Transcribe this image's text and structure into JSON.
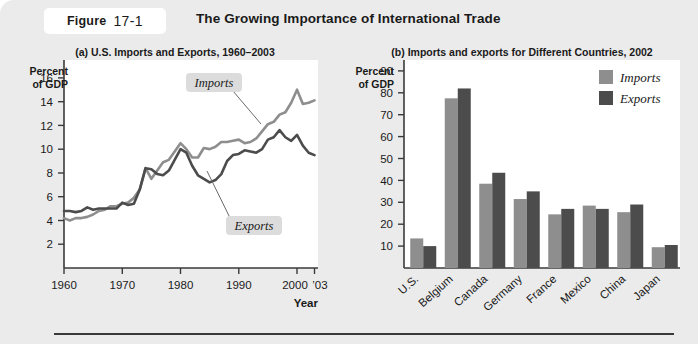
{
  "figure": {
    "tag_label": "Figure",
    "tag_number": "17-1",
    "title": "The Growing Importance of International Trade"
  },
  "colors": {
    "page_background": "#ebebeb",
    "plot_background": "#ffffff",
    "imports_series": "#8e8e8e",
    "exports_series": "#4c4c4c",
    "axis": "#3a3a3a",
    "text": "#1a1a1a",
    "callout_background": "#dcdcdc",
    "rule": "#3a3a3a"
  },
  "panel_a": {
    "title": "(a) U.S. Imports and Exports, 1960–2003",
    "y_axis_caption_line1": "Percent",
    "y_axis_caption_line2": "of GDP",
    "x_axis_caption": "Year",
    "y_ticks": [
      "2",
      "4",
      "6",
      "8",
      "10",
      "12",
      "14",
      "16"
    ],
    "x_ticks": [
      "1960",
      "1970",
      "1980",
      "1990",
      "2000",
      "’03"
    ],
    "callouts": [
      {
        "name": "imports-callout",
        "text": "Imports"
      },
      {
        "name": "exports-callout",
        "text": "Exports"
      }
    ]
  },
  "panel_b": {
    "title": "(b) Imports and exports for Different Countries, 2002",
    "y_axis_caption_line1": "Percent",
    "y_axis_caption_line2": "of GDP",
    "y_ticks": [
      "10",
      "20",
      "30",
      "40",
      "50",
      "60",
      "70",
      "80",
      "90"
    ],
    "legend": [
      {
        "name": "legend-imports",
        "label": "Imports",
        "color": "#8e8e8e"
      },
      {
        "name": "legend-exports",
        "label": "Exports",
        "color": "#4c4c4c"
      }
    ]
  },
  "chart_data": [
    {
      "type": "line",
      "id": "panel-a-line-chart",
      "title": "(a) U.S. Imports and Exports, 1960–2003",
      "xlabel": "Year",
      "ylabel": "Percent of GDP",
      "xlim": [
        1960,
        2003
      ],
      "ylim": [
        0,
        17.5
      ],
      "grid": false,
      "x": [
        1960,
        1961,
        1962,
        1963,
        1964,
        1965,
        1966,
        1967,
        1968,
        1969,
        1970,
        1971,
        1972,
        1973,
        1974,
        1975,
        1976,
        1977,
        1978,
        1979,
        1980,
        1981,
        1982,
        1983,
        1984,
        1985,
        1986,
        1987,
        1988,
        1989,
        1990,
        1991,
        1992,
        1993,
        1994,
        1995,
        1996,
        1997,
        1998,
        1999,
        2000,
        2001,
        2002,
        2003
      ],
      "series": [
        {
          "name": "Imports",
          "color": "#8e8e8e",
          "values": [
            4.2,
            4.0,
            4.2,
            4.2,
            4.3,
            4.5,
            4.8,
            4.9,
            5.2,
            5.2,
            5.4,
            5.5,
            5.9,
            6.6,
            8.4,
            7.5,
            8.2,
            8.9,
            9.1,
            9.8,
            10.5,
            10.0,
            9.3,
            9.3,
            10.1,
            10.0,
            10.2,
            10.6,
            10.6,
            10.7,
            10.8,
            10.5,
            10.6,
            10.9,
            11.5,
            12.1,
            12.3,
            12.9,
            13.1,
            13.9,
            15.0,
            13.8,
            13.9,
            14.1
          ]
        },
        {
          "name": "Exports",
          "color": "#4c4c4c",
          "values": [
            4.8,
            4.8,
            4.7,
            4.8,
            5.1,
            4.9,
            5.0,
            5.0,
            5.0,
            5.0,
            5.5,
            5.3,
            5.4,
            6.6,
            8.4,
            8.3,
            7.9,
            7.8,
            8.2,
            9.1,
            10.0,
            9.7,
            8.6,
            7.8,
            7.5,
            7.2,
            7.4,
            7.9,
            9.0,
            9.5,
            9.6,
            9.9,
            9.8,
            9.7,
            10.0,
            10.8,
            11.0,
            11.6,
            11.0,
            10.7,
            11.2,
            10.3,
            9.7,
            9.5
          ]
        }
      ]
    },
    {
      "type": "bar",
      "id": "panel-b-bar-chart",
      "title": "(b) Imports and exports for Different Countries, 2002",
      "xlabel": "",
      "ylabel": "Percent of GDP",
      "ylim": [
        0,
        95
      ],
      "grid": false,
      "legend_position": "top-right",
      "categories": [
        "U.S.",
        "Belgium",
        "Canada",
        "Germany",
        "France",
        "Mexico",
        "China",
        "Japan"
      ],
      "series": [
        {
          "name": "Imports",
          "color": "#8e8e8e",
          "values": [
            13.5,
            77.5,
            38.5,
            31.5,
            24.5,
            28.5,
            25.5,
            9.5
          ]
        },
        {
          "name": "Exports",
          "color": "#4c4c4c",
          "values": [
            10.0,
            82.0,
            43.5,
            35.0,
            27.0,
            27.0,
            29.0,
            10.5
          ]
        }
      ]
    }
  ]
}
